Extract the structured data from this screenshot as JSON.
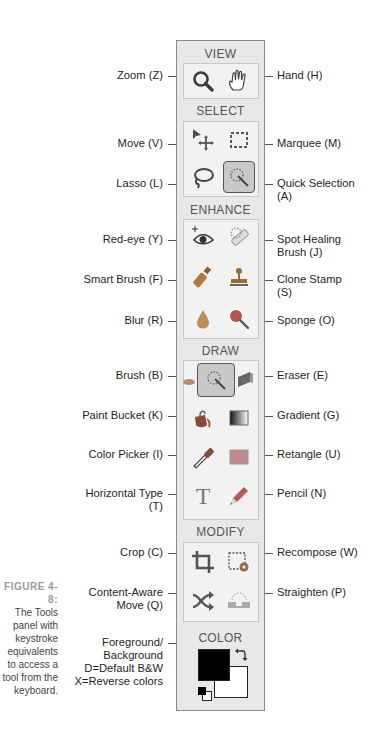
{
  "panel": {
    "sections": {
      "view": "VIEW",
      "select": "SELECT",
      "enhance": "ENHANCE",
      "draw": "DRAW",
      "modify": "MODIFY",
      "color": "COLOR"
    }
  },
  "labels": {
    "zoom": "Zoom (Z)",
    "hand": "Hand (H)",
    "move": "Move (V)",
    "marquee": "Marquee (M)",
    "lasso": "Lasso (L)",
    "quick_selection_1": "Quick Selection",
    "quick_selection_2": "(A)",
    "red_eye": "Red-eye (Y)",
    "spot_healing_1": "Spot Healing",
    "spot_healing_2": "Brush (J)",
    "smart_brush": "Smart Brush (F)",
    "clone_stamp_1": "Clone Stamp",
    "clone_stamp_2": "(S)",
    "blur": "Blur (R)",
    "sponge": "Sponge (O)",
    "brush": "Brush (B)",
    "eraser": "Eraser (E)",
    "paint_bucket": "Paint Bucket (K)",
    "gradient": "Gradient (G)",
    "color_picker": "Color Picker (I)",
    "rectangle": "Retangle (U)",
    "horizontal_type_1": "Horizontal Type",
    "horizontal_type_2": "(T)",
    "pencil": "Pencil (N)",
    "crop": "Crop (C)",
    "recompose": "Recompose (W)",
    "content_aware_1": "Content-Aware",
    "content_aware_2": "Move (Q)",
    "straighten": "Straighten (P)",
    "fg_bg_1": "Foreground/",
    "fg_bg_2": "Background",
    "fg_bg_3": "D=Default B&W",
    "fg_bg_4": "X=Reverse colors"
  },
  "caption": {
    "figure": "FIGURE 4-8:",
    "lines": [
      "The Tools",
      "panel with",
      "keystroke",
      "equivalents",
      "to access a",
      "tool from the",
      "keyboard."
    ]
  },
  "colors": {
    "panel_bg": "#e8e8e8",
    "selected_tool_bg": "#c8c8c8",
    "foreground": "#000000",
    "background": "#ffffff"
  }
}
